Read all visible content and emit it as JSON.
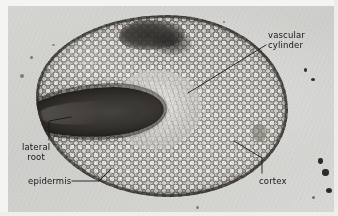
{
  "figure": {
    "kind": "light-micrograph",
    "caption_labels_count": 4
  },
  "labels": {
    "vascular_cylinder": {
      "line1": "vascular",
      "line2": "cylinder"
    },
    "lateral_root": {
      "line1": "lateral",
      "line2": "root"
    },
    "epidermis": {
      "text": "epidermis"
    },
    "cortex": {
      "text": "cortex"
    }
  },
  "structures": [
    {
      "name": "vascular-cylinder",
      "description": "pale central stele"
    },
    {
      "name": "lateral-root",
      "description": "dark elongated emerging branch root at left"
    },
    {
      "name": "epidermis",
      "description": "dark outer cell layer bounding the section"
    },
    {
      "name": "cortex",
      "description": "broad zone of rounded parenchyma cells"
    }
  ],
  "colors": {
    "plate_background": "#d6d6d3",
    "paper_margin": "#f4f4f2",
    "label_text": "#171614",
    "leader_line": "#1a1918",
    "cortex_mid": "#b9b6b0",
    "lateral_root_dark": "#1d1b19",
    "vascular_pale": "#ecebe7"
  }
}
